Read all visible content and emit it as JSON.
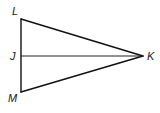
{
  "diagram": {
    "type": "geometry-triangle",
    "vertices": [
      {
        "id": "L",
        "label": "L",
        "x": 21,
        "y": 19,
        "label_x": 12,
        "label_y": 15
      },
      {
        "id": "J",
        "label": "J",
        "x": 21,
        "y": 56,
        "label_x": 10,
        "label_y": 60
      },
      {
        "id": "M",
        "label": "M",
        "x": 21,
        "y": 92,
        "label_x": 8,
        "label_y": 102
      },
      {
        "id": "K",
        "label": "K",
        "x": 143,
        "y": 56,
        "label_x": 147,
        "label_y": 60
      }
    ],
    "segments": [
      {
        "from": "L",
        "to": "K"
      },
      {
        "from": "K",
        "to": "M"
      },
      {
        "from": "M",
        "to": "L"
      },
      {
        "from": "J",
        "to": "K"
      }
    ],
    "colors": {
      "stroke": "#111111",
      "label": "#1a1a1a",
      "background": "#ffffff"
    }
  }
}
